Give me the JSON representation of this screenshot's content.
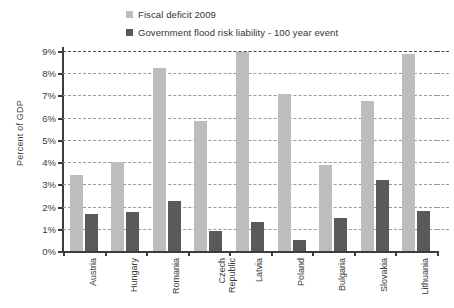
{
  "chart_data": {
    "type": "bar",
    "title": "",
    "xlabel": "",
    "ylabel": "Percent of GDP",
    "ylim": [
      0,
      9
    ],
    "ytick_labels": [
      "9%",
      "8%",
      "7%",
      "6%",
      "5%",
      "4%",
      "3%",
      "2%",
      "1%",
      "0%"
    ],
    "ytick_values": [
      9,
      8,
      7,
      6,
      5,
      4,
      3,
      2,
      1,
      0
    ],
    "grid": true,
    "legend_position": "top-center",
    "categories": [
      "Austria",
      "Hungary",
      "Romania",
      "Czech Republic",
      "Latvia",
      "Poland",
      "Bulgaria",
      "Slovakia",
      "Lithuania"
    ],
    "series": [
      {
        "name": "Fiscal deficit 2009",
        "color": "#bdbdbd",
        "values": [
          3.4,
          4.0,
          8.25,
          5.85,
          8.95,
          7.05,
          3.85,
          6.75,
          8.85
        ]
      },
      {
        "name": "Government flood risk liability - 100 year event",
        "color": "#5a5a5a",
        "values": [
          1.65,
          1.75,
          2.25,
          0.9,
          1.3,
          0.5,
          1.5,
          3.2,
          1.8
        ]
      }
    ]
  },
  "legend": {
    "items": [
      {
        "label": "Fiscal deficit 2009",
        "color": "#bdbdbd"
      },
      {
        "label": "Government flood risk liability - 100 year event",
        "color": "#5a5a5a"
      }
    ]
  },
  "axes": {
    "y_title": "Percent of GDP"
  },
  "colors": {
    "series_light": "#bdbdbd",
    "series_dark": "#5a5a5a",
    "axis": "#3c3c3c",
    "grid": "#9a9a9a",
    "grid_top": "#4a4a4a",
    "text": "#3a3a3a"
  }
}
